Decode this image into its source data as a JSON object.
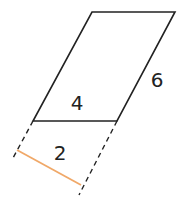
{
  "diagram": {
    "type": "parallelogram-with-perpendicular-height",
    "labels": {
      "base": "4",
      "side": "6",
      "height": "2"
    },
    "colors": {
      "stroke": "#222222",
      "height_segment": "#F0A868",
      "background": "#FFFFFF"
    },
    "vertices": {
      "top_left": [
        92,
        12
      ],
      "top_right": [
        175,
        12
      ],
      "bottom_right": [
        117,
        121
      ],
      "bottom_left": [
        33,
        121
      ]
    }
  }
}
